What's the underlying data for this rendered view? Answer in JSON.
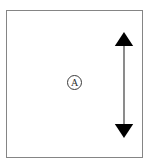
{
  "figure": {
    "width": 154,
    "height": 168,
    "background_color": "#ffffff",
    "frame": {
      "border_color": "#858585",
      "border_width_px": 1,
      "fill_color": "#ffffff",
      "x": 6,
      "y": 10,
      "width": 137,
      "height": 148
    },
    "labels": [
      {
        "name": "circled-letter-a",
        "text": "A",
        "style": "circled",
        "color": "#2b2b2b",
        "x": 67,
        "y": 75,
        "diameter_px": 15
      }
    ],
    "annotations": [
      {
        "name": "vertical-dimension-arrow",
        "type": "double-headed-arrow",
        "orientation": "vertical",
        "color": "#000000",
        "shaft_color": "#6f6f6f",
        "shaft_width_px": 1.5,
        "head_width_px": 18,
        "head_height_px": 13,
        "x_center": 124,
        "y_top": 33,
        "y_bottom": 136,
        "length_px": 103,
        "measure_label": ""
      }
    ]
  }
}
